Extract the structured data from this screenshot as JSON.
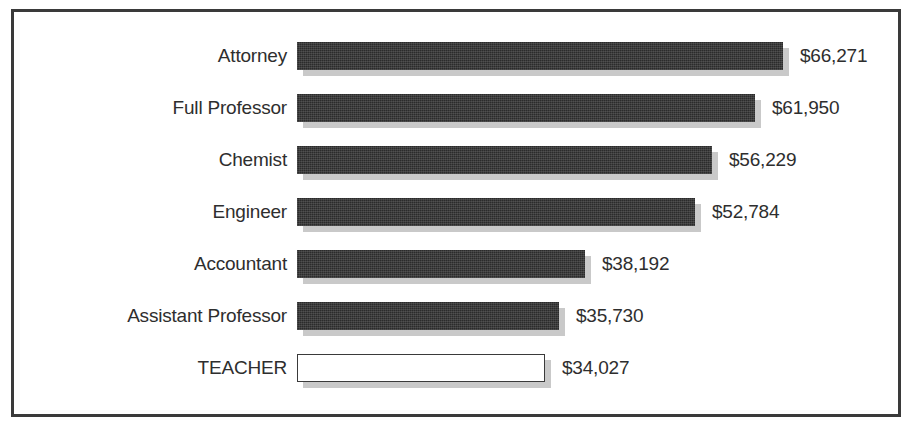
{
  "chart_data": {
    "type": "bar",
    "orientation": "horizontal",
    "title": "",
    "subtitle": "",
    "xlabel": "",
    "ylabel": "",
    "grid": false,
    "legend": null,
    "axis_visible": false,
    "value_prefix": "$",
    "categories": [
      "Attorney",
      "Full Professor",
      "Chemist",
      "Engineer",
      "Accountant",
      "Assistant Professor",
      "TEACHER"
    ],
    "values": [
      66271,
      61950,
      56229,
      52784,
      38192,
      35730,
      34027
    ],
    "value_labels": [
      "$66,271",
      "$61,950",
      "$56,229",
      "$52,784",
      "$38,192",
      "$35,730",
      "$34,027"
    ],
    "highlighted_category": "TEACHER",
    "bars": [
      {
        "label": "Attorney",
        "value": 66271,
        "value_label": "$66,271",
        "bar_px": 486,
        "style": "filled"
      },
      {
        "label": "Full Professor",
        "value": 61950,
        "value_label": "$61,950",
        "bar_px": 458,
        "style": "filled"
      },
      {
        "label": "Chemist",
        "value": 56229,
        "value_label": "$56,229",
        "bar_px": 415,
        "style": "filled"
      },
      {
        "label": "Engineer",
        "value": 52784,
        "value_label": "$52,784",
        "bar_px": 398,
        "style": "filled"
      },
      {
        "label": "Accountant",
        "value": 38192,
        "value_label": "$38,192",
        "bar_px": 288,
        "style": "filled"
      },
      {
        "label": "Assistant Professor",
        "value": 35730,
        "value_label": "$35,730",
        "bar_px": 262,
        "style": "filled"
      },
      {
        "label": "TEACHER",
        "value": 34027,
        "value_label": "$34,027",
        "bar_px": 248,
        "style": "highlight"
      }
    ]
  },
  "colors": {
    "frame_border": "#3a3a3a",
    "bar_fill": "#2b2b2b",
    "bar_shadow": "#c9c9c9",
    "highlight_fill": "#ffffff",
    "highlight_border": "#3a3a3a",
    "text": "#2e2e2e",
    "background": "#ffffff"
  }
}
